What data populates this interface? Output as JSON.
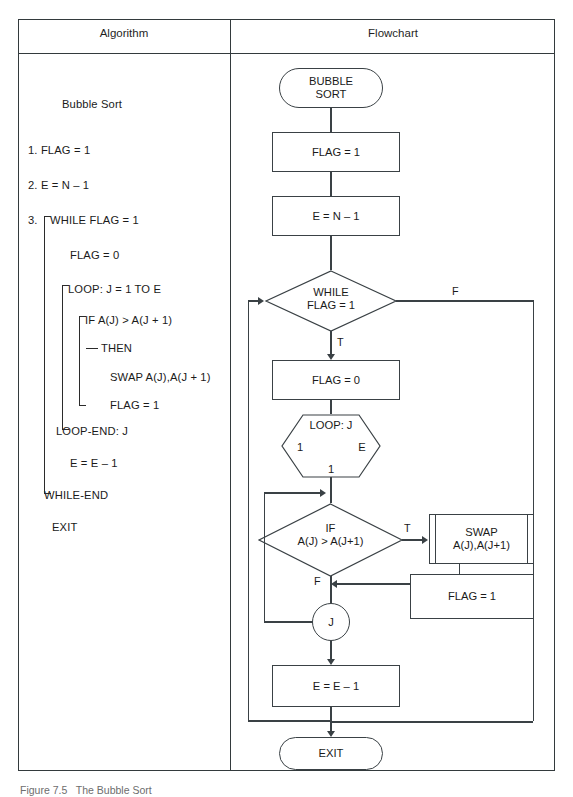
{
  "figure": {
    "caption": "Figure 7.5   The Bubble Sort"
  },
  "table": {
    "headers": {
      "algorithm": "Algorithm",
      "flowchart": "Flowchart"
    }
  },
  "algorithm": {
    "title": "Bubble Sort",
    "lines": [
      {
        "text": "1. FLAG = 1"
      },
      {
        "text": "2. E = N – 1"
      },
      {
        "text": "3."
      },
      {
        "text": "WHILE FLAG = 1"
      },
      {
        "text": "FLAG = 0"
      },
      {
        "text": "LOOP: J = 1 TO E"
      },
      {
        "text": "IF A(J) > A(J + 1)"
      },
      {
        "text": "THEN"
      },
      {
        "text": "SWAP A(J),A(J + 1)"
      },
      {
        "text": "FLAG = 1"
      },
      {
        "text": "LOOP-END: J"
      },
      {
        "text": "E = E – 1"
      },
      {
        "text": "WHILE-END"
      },
      {
        "text": "EXIT"
      }
    ]
  },
  "flowchart": {
    "nodes": {
      "start": {
        "label": "BUBBLE\nSORT",
        "type": "terminator"
      },
      "flag_init": {
        "label": "FLAG = 1",
        "type": "process"
      },
      "e_init": {
        "label": "E = N – 1",
        "type": "process"
      },
      "while_test": {
        "label": "WHILE\nFLAG = 1",
        "type": "decision"
      },
      "flag_reset": {
        "label": "FLAG = 0",
        "type": "process"
      },
      "loop_start": {
        "label": "LOOP: J",
        "type": "loop",
        "from": "1",
        "to": "E",
        "step": "1"
      },
      "if_test": {
        "label": "IF\nA(J) > A(J+1)",
        "type": "decision"
      },
      "swap": {
        "label": "SWAP\nA(J),A(J+1)",
        "type": "subprocess"
      },
      "flag_set": {
        "label": "FLAG = 1",
        "type": "process"
      },
      "loop_end": {
        "label": "J",
        "type": "connector"
      },
      "e_dec": {
        "label": "E = E – 1",
        "type": "process"
      },
      "exit": {
        "label": "EXIT",
        "type": "terminator"
      }
    },
    "edge_labels": {
      "while_false": "F",
      "while_true": "T",
      "if_true": "T",
      "if_false": "F"
    }
  }
}
